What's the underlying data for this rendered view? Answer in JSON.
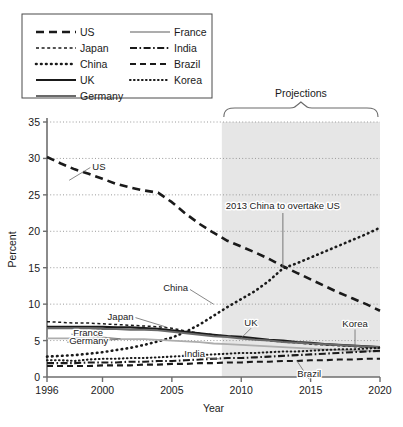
{
  "legend": {
    "items": [
      {
        "label": "US",
        "style": "dash-bold"
      },
      {
        "label": "France",
        "style": "solid-light"
      },
      {
        "label": "Japan",
        "style": "dash-fine"
      },
      {
        "label": "India",
        "style": "dash-dot"
      },
      {
        "label": "China",
        "style": "dotted-bold"
      },
      {
        "label": "Brazil",
        "style": "dash-med"
      },
      {
        "label": "UK",
        "style": "solid-bold"
      },
      {
        "label": "Korea",
        "style": "dotted-med"
      },
      {
        "label": "Germany",
        "style": "solid-med"
      }
    ]
  },
  "projections": {
    "brace_label": "Projections",
    "start_year": 2008.6
  },
  "annotation": {
    "text": "2013 China to overtake US",
    "point_year": 2013,
    "point_value": 15
  },
  "chart_data": {
    "type": "line",
    "title": "",
    "xlabel": "Year",
    "ylabel": "Percent",
    "xlim": [
      1996,
      2020
    ],
    "ylim": [
      0,
      35
    ],
    "xticks": [
      1996,
      2000,
      2005,
      2010,
      2015,
      2020
    ],
    "yticks": [
      0,
      5,
      10,
      15,
      20,
      25,
      30,
      35
    ],
    "grid": "horizontal-dotted",
    "legend_position": "above-left",
    "series": [
      {
        "name": "US",
        "label_year": 1998.4,
        "label_value": 28.2,
        "x": [
          1996,
          1997,
          1998,
          1999,
          2000,
          2001,
          2002,
          2003,
          2004,
          2005,
          2006,
          2007,
          2008,
          2009,
          2010,
          2011,
          2012,
          2013,
          2014,
          2015,
          2016,
          2017,
          2018,
          2019,
          2020
        ],
        "values": [
          30.2,
          29.3,
          28.5,
          27.9,
          27.2,
          26.5,
          26.0,
          25.6,
          25.3,
          24.0,
          22.4,
          21.0,
          19.8,
          18.7,
          17.9,
          17.1,
          16.2,
          15.2,
          14.3,
          13.4,
          12.5,
          11.6,
          10.8,
          10.0,
          9.1
        ]
      },
      {
        "name": "China",
        "label_year": 2007.1,
        "label_value": 11.6,
        "x": [
          1996,
          1997,
          1998,
          1999,
          2000,
          2001,
          2002,
          2003,
          2004,
          2005,
          2006,
          2007,
          2008,
          2009,
          2010,
          2011,
          2012,
          2013,
          2014,
          2015,
          2016,
          2017,
          2018,
          2019,
          2020
        ],
        "values": [
          2.8,
          2.9,
          3.0,
          3.2,
          3.4,
          3.7,
          4.0,
          4.4,
          4.9,
          5.4,
          6.2,
          7.2,
          8.4,
          9.6,
          10.7,
          11.8,
          13.2,
          14.9,
          15.6,
          16.4,
          17.2,
          18.0,
          18.8,
          19.6,
          20.5
        ]
      },
      {
        "name": "Japan",
        "label_year": 2003.1,
        "label_value": 7.6,
        "x": [
          1996,
          1997,
          1998,
          1999,
          2000,
          2001,
          2002,
          2003,
          2004,
          2005,
          2006,
          2007,
          2008,
          2009,
          2010,
          2011,
          2012,
          2013,
          2014,
          2015,
          2016,
          2017,
          2018,
          2019,
          2020
        ],
        "values": [
          7.6,
          7.5,
          7.4,
          7.4,
          7.3,
          7.2,
          7.1,
          7.0,
          6.9,
          6.7,
          6.3,
          6.0,
          5.8,
          5.6,
          5.4,
          5.2,
          5.0,
          4.8,
          4.7,
          4.5,
          4.4,
          4.3,
          4.2,
          4.1,
          4.0
        ]
      },
      {
        "name": "UK",
        "label_year": 2010.7,
        "label_value": 6.0,
        "x": [
          1996,
          1997,
          1998,
          1999,
          2000,
          2001,
          2002,
          2003,
          2004,
          2005,
          2006,
          2007,
          2008,
          2009,
          2010,
          2011,
          2012,
          2013,
          2014,
          2015,
          2016,
          2017,
          2018,
          2019,
          2020
        ],
        "values": [
          6.9,
          6.9,
          6.9,
          6.9,
          6.9,
          6.8,
          6.8,
          6.7,
          6.6,
          6.4,
          6.2,
          6.0,
          5.8,
          5.6,
          5.5,
          5.3,
          5.1,
          5.0,
          4.8,
          4.7,
          4.5,
          4.4,
          4.3,
          4.2,
          4.1
        ]
      },
      {
        "name": "Germany",
        "label_year": 1997.6,
        "label_value": 4.5,
        "x": [
          1996,
          1997,
          1998,
          1999,
          2000,
          2001,
          2002,
          2003,
          2004,
          2005,
          2006,
          2007,
          2008,
          2009,
          2010,
          2011,
          2012,
          2013,
          2014,
          2015,
          2016,
          2017,
          2018,
          2019,
          2020
        ],
        "values": [
          6.7,
          6.7,
          6.7,
          6.7,
          6.6,
          6.6,
          6.5,
          6.5,
          6.4,
          6.2,
          6.0,
          5.8,
          5.6,
          5.5,
          5.3,
          5.1,
          5.0,
          4.8,
          4.7,
          4.6,
          4.5,
          4.4,
          4.3,
          4.2,
          4.1
        ]
      },
      {
        "name": "France",
        "label_year": 1997.9,
        "label_value": 5.6,
        "x": [
          1996,
          1997,
          1998,
          1999,
          2000,
          2001,
          2002,
          2003,
          2004,
          2005,
          2006,
          2007,
          2008,
          2009,
          2010,
          2011,
          2012,
          2013,
          2014,
          2015,
          2016,
          2017,
          2018,
          2019,
          2020
        ],
        "values": [
          5.3,
          5.3,
          5.3,
          5.3,
          5.3,
          5.2,
          5.2,
          5.2,
          5.1,
          5.0,
          4.9,
          4.8,
          4.6,
          4.5,
          4.4,
          4.3,
          4.2,
          4.1,
          4.0,
          3.9,
          3.8,
          3.7,
          3.6,
          3.6,
          3.5
        ]
      },
      {
        "name": "Korea",
        "label_year": 2018.2,
        "label_value": 5.7,
        "x": [
          1996,
          1997,
          1998,
          1999,
          2000,
          2001,
          2002,
          2003,
          2004,
          2005,
          2006,
          2007,
          2008,
          2009,
          2010,
          2011,
          2012,
          2013,
          2014,
          2015,
          2016,
          2017,
          2018,
          2019,
          2020
        ],
        "values": [
          2.3,
          2.3,
          2.2,
          2.4,
          2.5,
          2.5,
          2.6,
          2.6,
          2.7,
          2.8,
          2.9,
          3.0,
          3.1,
          3.2,
          3.3,
          3.3,
          3.4,
          3.5,
          3.5,
          3.6,
          3.7,
          3.8,
          3.8,
          3.9,
          4.0
        ]
      },
      {
        "name": "India",
        "label_year": 2005.9,
        "label_value": 2.6,
        "x": [
          1996,
          1997,
          1998,
          1999,
          2000,
          2001,
          2002,
          2003,
          2004,
          2005,
          2006,
          2007,
          2008,
          2009,
          2010,
          2011,
          2012,
          2013,
          2014,
          2015,
          2016,
          2017,
          2018,
          2019,
          2020
        ],
        "values": [
          1.9,
          1.9,
          1.9,
          2.0,
          2.0,
          2.0,
          2.1,
          2.1,
          2.2,
          2.2,
          2.3,
          2.4,
          2.5,
          2.6,
          2.6,
          2.7,
          2.8,
          2.9,
          3.0,
          3.1,
          3.2,
          3.3,
          3.4,
          3.5,
          3.6
        ]
      },
      {
        "name": "Brazil",
        "label_year": 2014.9,
        "label_value": 1.2,
        "x": [
          1996,
          1997,
          1998,
          1999,
          2000,
          2001,
          2002,
          2003,
          2004,
          2005,
          2006,
          2007,
          2008,
          2009,
          2010,
          2011,
          2012,
          2013,
          2014,
          2015,
          2016,
          2017,
          2018,
          2019,
          2020
        ],
        "values": [
          1.5,
          1.5,
          1.5,
          1.5,
          1.6,
          1.6,
          1.6,
          1.7,
          1.7,
          1.8,
          1.8,
          1.9,
          1.9,
          2.0,
          2.0,
          2.1,
          2.1,
          2.2,
          2.2,
          2.3,
          2.3,
          2.4,
          2.4,
          2.5,
          2.5
        ]
      }
    ]
  },
  "colors": {
    "ink": "#1a1a1a",
    "axis": "#6e6e6e",
    "grid": "#9a9a9a",
    "shade": "#e6e6e6",
    "light_line": "#adadad",
    "medium_line": "#6a6a6a"
  }
}
